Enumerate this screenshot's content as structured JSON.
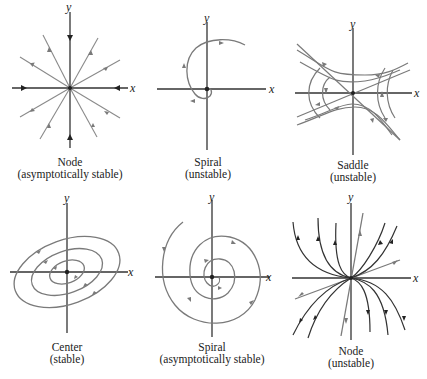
{
  "figure": {
    "colors": {
      "axis": "#333333",
      "trajectory_gray": "#7a7a7a",
      "trajectory_dark": "#3a3a3a",
      "background": "#ffffff"
    },
    "axis_labels": {
      "x": "x",
      "y": "y"
    },
    "panels": [
      {
        "id": "node-stable",
        "name": "Node",
        "stability": "(asymptotically stable)"
      },
      {
        "id": "spiral-unstable",
        "name": "Spiral",
        "stability": "(unstable)"
      },
      {
        "id": "saddle",
        "name": "Saddle",
        "stability": "(unstable)"
      },
      {
        "id": "center",
        "name": "Center",
        "stability": "(stable)"
      },
      {
        "id": "spiral-stable",
        "name": "Spiral",
        "stability": "(asymptotically stable)"
      },
      {
        "id": "node-unstable",
        "name": "Node",
        "stability": "(unstable)"
      }
    ]
  }
}
